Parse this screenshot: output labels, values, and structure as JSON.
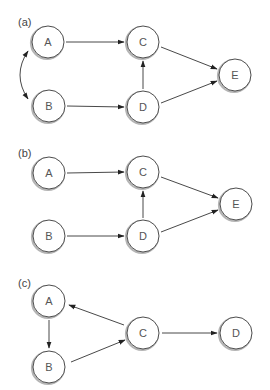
{
  "figure": {
    "panels": [
      {
        "label": "(a)",
        "label_pos": [
          18,
          26
        ],
        "nodes": [
          {
            "id": "A",
            "label": "A",
            "cx": 48,
            "cy": 42
          },
          {
            "id": "B",
            "label": "B",
            "cx": 49,
            "cy": 106
          },
          {
            "id": "C",
            "label": "C",
            "cx": 143,
            "cy": 42
          },
          {
            "id": "D",
            "label": "D",
            "cx": 143,
            "cy": 107
          },
          {
            "id": "E",
            "label": "E",
            "cx": 235,
            "cy": 75
          }
        ],
        "edges": [
          {
            "from": "A",
            "to": "C",
            "type": "directed"
          },
          {
            "from": "B",
            "to": "D",
            "type": "directed"
          },
          {
            "from": "D",
            "to": "C",
            "type": "directed"
          },
          {
            "from": "C",
            "to": "E",
            "type": "directed"
          },
          {
            "from": "D",
            "to": "E",
            "type": "directed"
          },
          {
            "from": "A",
            "to": "B",
            "type": "bidirected-curved"
          }
        ]
      },
      {
        "label": "(b)",
        "label_pos": [
          18,
          157
        ],
        "nodes": [
          {
            "id": "A",
            "label": "A",
            "cx": 49,
            "cy": 173
          },
          {
            "id": "B",
            "label": "B",
            "cx": 49,
            "cy": 236
          },
          {
            "id": "C",
            "label": "C",
            "cx": 143,
            "cy": 172
          },
          {
            "id": "D",
            "label": "D",
            "cx": 143,
            "cy": 236
          },
          {
            "id": "E",
            "label": "E",
            "cx": 236,
            "cy": 204
          }
        ],
        "edges": [
          {
            "from": "A",
            "to": "C",
            "type": "directed"
          },
          {
            "from": "B",
            "to": "D",
            "type": "directed"
          },
          {
            "from": "D",
            "to": "C",
            "type": "directed"
          },
          {
            "from": "C",
            "to": "E",
            "type": "directed"
          },
          {
            "from": "D",
            "to": "E",
            "type": "directed"
          }
        ]
      },
      {
        "label": "(c)",
        "label_pos": [
          18,
          287
        ],
        "nodes": [
          {
            "id": "A",
            "label": "A",
            "cx": 49,
            "cy": 301
          },
          {
            "id": "B",
            "label": "B",
            "cx": 49,
            "cy": 367
          },
          {
            "id": "C",
            "label": "C",
            "cx": 143,
            "cy": 333
          },
          {
            "id": "D",
            "label": "D",
            "cx": 236,
            "cy": 333
          }
        ],
        "edges": [
          {
            "from": "A",
            "to": "B",
            "type": "directed"
          },
          {
            "from": "B",
            "to": "C",
            "type": "directed"
          },
          {
            "from": "C",
            "to": "A",
            "type": "directed"
          },
          {
            "from": "C",
            "to": "D",
            "type": "directed"
          }
        ]
      }
    ],
    "style": {
      "node_radius": 16,
      "stroke_color": "#333333",
      "background": "#ffffff"
    }
  }
}
